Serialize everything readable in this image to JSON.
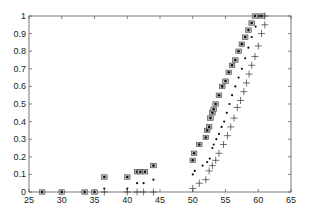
{
  "chart_data": {
    "type": "scatter",
    "title": "",
    "xlabel": "",
    "ylabel": "",
    "xlim": [
      25,
      65
    ],
    "ylim": [
      0,
      1
    ],
    "grid": false,
    "legend": null,
    "x_ticks": [
      "25",
      "30",
      "35",
      "40",
      "45",
      "50",
      "55",
      "60",
      "65"
    ],
    "y_ticks": [
      "0",
      "0.1",
      "0.2",
      "0.3",
      "0.4",
      "0.5",
      "0.6",
      "0.7",
      "0.8",
      "0.9",
      "1"
    ],
    "series": [
      {
        "name": "asterisk",
        "marker": "boxed-asterisk",
        "points": [
          [
            27,
            0
          ],
          [
            30,
            0
          ],
          [
            33.5,
            0
          ],
          [
            35,
            0
          ],
          [
            36.5,
            0.085
          ],
          [
            40,
            0.085
          ],
          [
            41.5,
            0.115
          ],
          [
            42,
            0.115
          ],
          [
            42.7,
            0.115
          ],
          [
            44,
            0.15
          ],
          [
            50,
            0.18
          ],
          [
            50.2,
            0.22
          ],
          [
            51,
            0.27
          ],
          [
            52,
            0.31
          ],
          [
            52.2,
            0.35
          ],
          [
            52.5,
            0.37
          ],
          [
            52.7,
            0.42
          ],
          [
            53,
            0.45
          ],
          [
            53.2,
            0.47
          ],
          [
            53.5,
            0.5
          ],
          [
            54,
            0.55
          ],
          [
            54.5,
            0.6
          ],
          [
            55,
            0.63
          ],
          [
            55.5,
            0.68
          ],
          [
            56,
            0.72
          ],
          [
            56.5,
            0.75
          ],
          [
            57,
            0.8
          ],
          [
            57.5,
            0.84
          ],
          [
            58,
            0.88
          ],
          [
            58.5,
            0.92
          ],
          [
            59,
            0.96
          ],
          [
            59.5,
            1.0
          ],
          [
            60.5,
            1.0
          ]
        ]
      },
      {
        "name": "dot",
        "marker": "dot",
        "points": [
          [
            36.5,
            0.02
          ],
          [
            40,
            0.02
          ],
          [
            41.5,
            0.05
          ],
          [
            42.5,
            0.05
          ],
          [
            44,
            0.07
          ],
          [
            50,
            0.1
          ],
          [
            50.3,
            0.12
          ],
          [
            51.5,
            0.15
          ],
          [
            52.2,
            0.17
          ],
          [
            52.6,
            0.19
          ],
          [
            53,
            0.25
          ],
          [
            53.2,
            0.27
          ],
          [
            53.6,
            0.3
          ],
          [
            54,
            0.33
          ],
          [
            54.4,
            0.37
          ],
          [
            54.8,
            0.4
          ],
          [
            55.2,
            0.45
          ],
          [
            55.6,
            0.5
          ],
          [
            56,
            0.55
          ],
          [
            56.5,
            0.6
          ],
          [
            57,
            0.65
          ],
          [
            57.5,
            0.7
          ],
          [
            58,
            0.76
          ],
          [
            58.5,
            0.82
          ],
          [
            59,
            0.88
          ],
          [
            59.6,
            0.94
          ],
          [
            60.2,
            1.0
          ]
        ]
      },
      {
        "name": "plus",
        "marker": "plus",
        "points": [
          [
            36.5,
            0
          ],
          [
            40,
            0
          ],
          [
            41.5,
            0
          ],
          [
            42.5,
            0
          ],
          [
            44,
            0
          ],
          [
            50,
            0.02
          ],
          [
            51,
            0.05
          ],
          [
            52,
            0.07
          ],
          [
            52.5,
            0.12
          ],
          [
            53,
            0.15
          ],
          [
            53.5,
            0.18
          ],
          [
            54,
            0.22
          ],
          [
            54.7,
            0.27
          ],
          [
            55.3,
            0.32
          ],
          [
            55.8,
            0.37
          ],
          [
            56.3,
            0.42
          ],
          [
            56.8,
            0.48
          ],
          [
            57.3,
            0.52
          ],
          [
            57.8,
            0.57
          ],
          [
            58.2,
            0.62
          ],
          [
            58.6,
            0.67
          ],
          [
            59,
            0.72
          ],
          [
            59.5,
            0.77
          ],
          [
            60,
            0.83
          ],
          [
            60.5,
            0.9
          ],
          [
            61,
            0.95
          ],
          [
            61,
            1.0
          ]
        ]
      }
    ]
  }
}
